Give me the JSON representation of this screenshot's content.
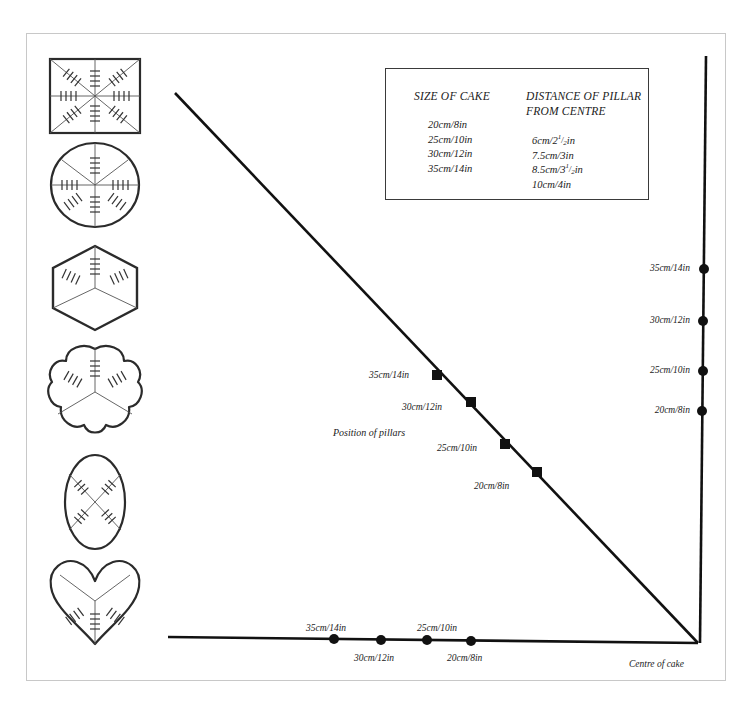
{
  "table": {
    "heading_size": "SIZE OF CAKE",
    "heading_distance_line1": "DISTANCE OF PILLAR",
    "heading_distance_line2": "FROM CENTRE",
    "sizes": [
      "20cm/8in",
      "25cm/10in",
      "30cm/12in",
      "35cm/14in"
    ],
    "distances": [
      {
        "whole": "6cm/2",
        "frac": "1/2",
        "unit": "in"
      },
      {
        "whole": "7.5cm/3",
        "frac": "",
        "unit": "in"
      },
      {
        "whole": "8.5cm/3",
        "frac": "1/2",
        "unit": "in"
      },
      {
        "whole": "10cm/4",
        "frac": "",
        "unit": "in"
      }
    ]
  },
  "graph": {
    "position_of_pillars_label": "Position of pillars",
    "centre_of_cake_label": "Centre of cake",
    "diagonal_markers": [
      {
        "label": "35cm/14in",
        "x": 437,
        "y": 375
      },
      {
        "label": "30cm/12in",
        "x": 471,
        "y": 402
      },
      {
        "label": "25cm/10in",
        "x": 505,
        "y": 444
      },
      {
        "label": "20cm/8in",
        "x": 537,
        "y": 472
      }
    ],
    "vertical_axis_markers": [
      {
        "label": "35cm/14in",
        "y": 269
      },
      {
        "label": "30cm/12in",
        "y": 321
      },
      {
        "label": "25cm/10in",
        "y": 371
      },
      {
        "label": "20cm/8in",
        "y": 411
      }
    ],
    "horizontal_axis_markers": [
      {
        "label": "35cm/14in",
        "x": 334,
        "above": true
      },
      {
        "label": "30cm/12in",
        "x": 381,
        "above": false
      },
      {
        "label": "25cm/10in",
        "x": 427,
        "above": true
      },
      {
        "label": "20cm/8in",
        "x": 471,
        "above": false
      }
    ]
  },
  "shapes": [
    {
      "name": "square-cake",
      "top": 55
    },
    {
      "name": "round-cake",
      "top": 140
    },
    {
      "name": "hexagonal-cake",
      "top": 242
    },
    {
      "name": "petal-cake",
      "top": 344
    },
    {
      "name": "oval-cake",
      "top": 452
    },
    {
      "name": "heart-cake",
      "top": 556
    }
  ],
  "colors": {
    "ink": "#1a1a1a",
    "outline": "#2b2b2b",
    "frame": "#c8c8c8",
    "paper": "#ffffff"
  }
}
